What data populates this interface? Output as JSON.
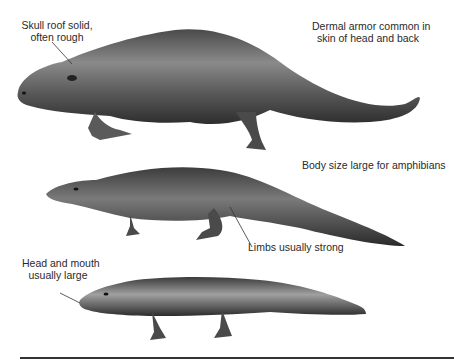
{
  "figure": {
    "labels": {
      "skull_roof": [
        "Skull roof solid,",
        "often rough"
      ],
      "dermal_armor": [
        "Dermal armor common in",
        "skin of head and back"
      ],
      "body_size": "Body size large for amphibians",
      "limbs": "Limbs usually strong",
      "head_mouth": [
        "Head and mouth",
        "usually large"
      ]
    },
    "animals": [
      {
        "name": "large-armored-amphibian"
      },
      {
        "name": "long-tailed-amphibian"
      },
      {
        "name": "salamander-like-amphibian"
      }
    ],
    "colors": {
      "skin_dark": "#3a3a3a",
      "skin_mid": "#6a6a6a",
      "skin_light": "#b5b5b5",
      "rule": "#333333"
    }
  }
}
